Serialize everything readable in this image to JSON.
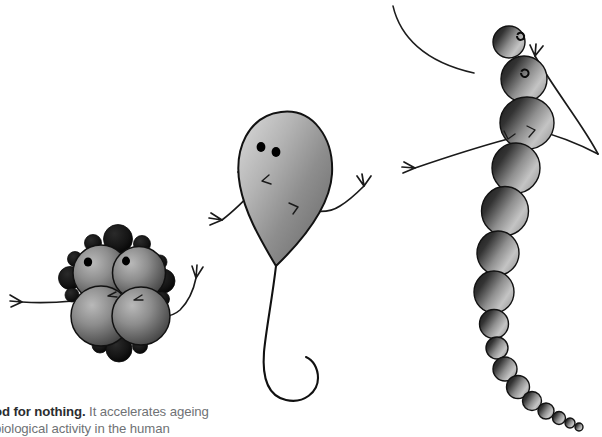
{
  "page": {
    "background_color": "#ffffff",
    "width": 602,
    "height": 434
  },
  "caption": {
    "lead_text": "od for nothing.",
    "body_text": " It accelerates ageing",
    "second_line": "biological activity in the human",
    "lead_color": "#2b2d2f",
    "body_color": "#6f7275"
  },
  "illustration": {
    "title": "three stylized microbe cartoon characters",
    "stroke_color": "#1a1a1a",
    "circle_gradient_dark": "#262626",
    "circle_gradient_light": "#c9c9c9",
    "accent_dark": "#101010",
    "creatures": [
      {
        "name": "cluster-microbe",
        "label": "staphylococcus-like cluster creature",
        "position": "left",
        "big_circle_count": 4,
        "small_circle_count": 12,
        "eye_count": 2,
        "limb_count": 2
      },
      {
        "name": "teardrop-microbe",
        "label": "sperm-like teardrop creature with curling tail",
        "position": "center",
        "eye_count": 2,
        "limb_count": 2,
        "has_tail": true
      },
      {
        "name": "chain-microbe",
        "label": "streptococcus-like chain creature",
        "position": "right",
        "chain_circle_count": 16,
        "eye_count": 2,
        "limb_count": 2,
        "has_antenna_arc": true
      }
    ]
  }
}
